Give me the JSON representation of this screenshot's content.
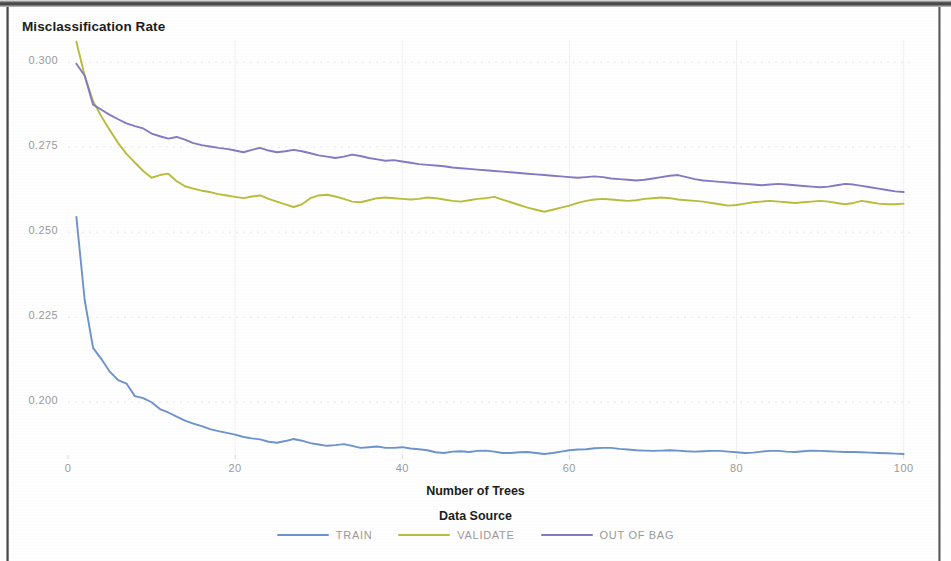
{
  "chart_data": {
    "type": "line",
    "title": "Misclassification Rate",
    "xlabel": "Number of Trees",
    "ylabel": "Misclassification Rate",
    "legend_title": "Data Source",
    "legend_position": "bottom",
    "grid": true,
    "xlim": [
      0,
      101
    ],
    "ylim": [
      0.1845,
      0.3065
    ],
    "xticks": [
      0,
      20,
      40,
      60,
      80,
      100
    ],
    "xtick_labels": [
      "0",
      "20",
      "40",
      "60",
      "80",
      "100"
    ],
    "yticks": [
      0.2,
      0.225,
      0.25,
      0.275,
      0.3
    ],
    "ytick_labels": [
      "0.200",
      "0.225",
      "0.250",
      "0.275",
      "0.300"
    ],
    "x": [
      1,
      2,
      3,
      4,
      5,
      6,
      7,
      8,
      9,
      10,
      11,
      12,
      13,
      14,
      15,
      16,
      17,
      18,
      19,
      20,
      21,
      22,
      23,
      24,
      25,
      26,
      27,
      28,
      29,
      30,
      31,
      32,
      33,
      34,
      35,
      36,
      37,
      38,
      39,
      40,
      41,
      42,
      43,
      44,
      45,
      46,
      47,
      48,
      49,
      50,
      51,
      52,
      53,
      54,
      55,
      56,
      57,
      58,
      59,
      60,
      61,
      62,
      63,
      64,
      65,
      66,
      67,
      68,
      69,
      70,
      71,
      72,
      73,
      74,
      75,
      76,
      77,
      78,
      79,
      80,
      81,
      82,
      83,
      84,
      85,
      86,
      87,
      88,
      89,
      90,
      91,
      92,
      93,
      94,
      95,
      96,
      97,
      98,
      99,
      100
    ],
    "series": [
      {
        "name": "TRAIN",
        "color": "#6d93cd",
        "values": [
          0.2545,
          0.23,
          0.216,
          0.2127,
          0.209,
          0.2065,
          0.2055,
          0.2018,
          0.2012,
          0.2,
          0.198,
          0.197,
          0.1958,
          0.1946,
          0.1937,
          0.193,
          0.1921,
          0.1915,
          0.191,
          0.1905,
          0.1898,
          0.1894,
          0.1891,
          0.1884,
          0.1881,
          0.1886,
          0.1892,
          0.1887,
          0.188,
          0.1876,
          0.1872,
          0.1874,
          0.1877,
          0.1872,
          0.1866,
          0.1868,
          0.187,
          0.1866,
          0.1866,
          0.1868,
          0.1864,
          0.1862,
          0.1859,
          0.1853,
          0.1851,
          0.1855,
          0.1856,
          0.1854,
          0.1857,
          0.1858,
          0.1855,
          0.1851,
          0.1851,
          0.1853,
          0.1854,
          0.1851,
          0.1848,
          0.1851,
          0.1855,
          0.1859,
          0.1861,
          0.1862,
          0.1865,
          0.1866,
          0.1866,
          0.1863,
          0.1861,
          0.1859,
          0.1858,
          0.1857,
          0.1858,
          0.1859,
          0.1858,
          0.1856,
          0.1855,
          0.1856,
          0.1857,
          0.1857,
          0.1855,
          0.1853,
          0.1851,
          0.1852,
          0.1855,
          0.1857,
          0.1857,
          0.1855,
          0.1854,
          0.1856,
          0.1858,
          0.1857,
          0.1856,
          0.1855,
          0.1854,
          0.1854,
          0.1853,
          0.1852,
          0.1851,
          0.185,
          0.1849,
          0.1848
        ]
      },
      {
        "name": "VALIDATE",
        "color": "#b9bd3b",
        "values": [
          0.306,
          0.296,
          0.2885,
          0.284,
          0.28,
          0.2762,
          0.273,
          0.2705,
          0.268,
          0.266,
          0.2668,
          0.2672,
          0.265,
          0.2635,
          0.2628,
          0.2622,
          0.2618,
          0.2612,
          0.2608,
          0.2604,
          0.26,
          0.2605,
          0.2608,
          0.2598,
          0.259,
          0.2582,
          0.2574,
          0.2582,
          0.26,
          0.2608,
          0.261,
          0.2605,
          0.2598,
          0.259,
          0.2588,
          0.2594,
          0.26,
          0.2602,
          0.26,
          0.2598,
          0.2596,
          0.2598,
          0.2602,
          0.26,
          0.2596,
          0.2592,
          0.259,
          0.2594,
          0.2598,
          0.26,
          0.2604,
          0.2596,
          0.2588,
          0.258,
          0.2572,
          0.2566,
          0.256,
          0.2566,
          0.2572,
          0.2578,
          0.2586,
          0.2592,
          0.2596,
          0.2598,
          0.2596,
          0.2594,
          0.2592,
          0.2594,
          0.2598,
          0.26,
          0.2602,
          0.26,
          0.2596,
          0.2594,
          0.2592,
          0.259,
          0.2586,
          0.2582,
          0.2578,
          0.258,
          0.2584,
          0.2588,
          0.259,
          0.2592,
          0.259,
          0.2588,
          0.2586,
          0.2588,
          0.259,
          0.2592,
          0.259,
          0.2586,
          0.2582,
          0.2586,
          0.2592,
          0.2588,
          0.2584,
          0.2582,
          0.2582,
          0.2584
        ]
      },
      {
        "name": "OUT OF BAG",
        "color": "#8579c3",
        "values": [
          0.2995,
          0.296,
          0.2875,
          0.286,
          0.2845,
          0.2832,
          0.282,
          0.2812,
          0.2805,
          0.279,
          0.2782,
          0.2775,
          0.278,
          0.2772,
          0.2762,
          0.2756,
          0.2752,
          0.2748,
          0.2745,
          0.274,
          0.2735,
          0.2742,
          0.2748,
          0.274,
          0.2735,
          0.2738,
          0.2742,
          0.2738,
          0.2732,
          0.2726,
          0.2722,
          0.2718,
          0.2722,
          0.2728,
          0.2724,
          0.2718,
          0.2714,
          0.271,
          0.2712,
          0.2708,
          0.2704,
          0.27,
          0.2698,
          0.2696,
          0.2694,
          0.269,
          0.2688,
          0.2686,
          0.2684,
          0.2682,
          0.268,
          0.2678,
          0.2676,
          0.2674,
          0.2672,
          0.267,
          0.2668,
          0.2666,
          0.2664,
          0.2662,
          0.266,
          0.2662,
          0.2664,
          0.2662,
          0.2658,
          0.2656,
          0.2654,
          0.2652,
          0.2654,
          0.2658,
          0.2662,
          0.2666,
          0.2668,
          0.2662,
          0.2656,
          0.2652,
          0.265,
          0.2648,
          0.2646,
          0.2644,
          0.2642,
          0.264,
          0.2638,
          0.264,
          0.2642,
          0.264,
          0.2638,
          0.2636,
          0.2634,
          0.2632,
          0.2634,
          0.2638,
          0.2642,
          0.264,
          0.2636,
          0.2632,
          0.2628,
          0.2624,
          0.262,
          0.2618
        ]
      }
    ]
  },
  "legend": {
    "title": "Data Source",
    "items": [
      {
        "label": "TRAIN",
        "color": "#6d93cd"
      },
      {
        "label": "VALIDATE",
        "color": "#b9bd3b"
      },
      {
        "label": "OUT OF BAG",
        "color": "#8579c3"
      }
    ]
  },
  "axes": {
    "y_title": "Misclassification Rate",
    "x_title": "Number of Trees"
  }
}
